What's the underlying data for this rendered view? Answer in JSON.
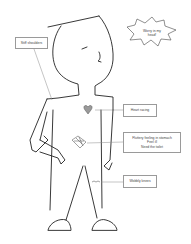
{
  "diagram": {
    "thought_bubble": {
      "line1": "Worry in my",
      "line2": "head!"
    },
    "labels": {
      "shoulders": "Stiff shoulders",
      "heart": "Heart racing",
      "stomach": {
        "line1": "Fluttery feeling in stomach",
        "line2": "Feel ill",
        "line3": "Need the toilet"
      },
      "knees": "Wobbly knees"
    },
    "colors": {
      "line": "#222222",
      "heart_fill": "#9a9a9a",
      "leader": "#8a8a8a",
      "box_border": "#9a9a9a"
    }
  }
}
